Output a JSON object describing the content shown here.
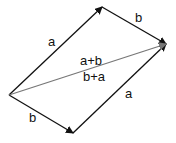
{
  "diagram": {
    "type": "vector-parallelogram",
    "vertices": {
      "origin": [
        9,
        95
      ],
      "top": [
        102,
        7
      ],
      "right": [
        166,
        44
      ],
      "bottom": [
        73,
        133
      ]
    },
    "vectors": [
      {
        "id": "a_top",
        "from": "origin",
        "to": "top",
        "label": "a",
        "color": "#111111"
      },
      {
        "id": "b_top",
        "from": "top",
        "to": "right",
        "label": "b",
        "color": "#111111"
      },
      {
        "id": "b_bottom",
        "from": "origin",
        "to": "bottom",
        "label": "b",
        "color": "#111111"
      },
      {
        "id": "a_bottom",
        "from": "bottom",
        "to": "right",
        "label": "a",
        "color": "#111111"
      },
      {
        "id": "sum",
        "from": "origin",
        "to": "right",
        "label_top": "a+b",
        "label_bottom": "b+a",
        "color": "#777777"
      }
    ]
  }
}
